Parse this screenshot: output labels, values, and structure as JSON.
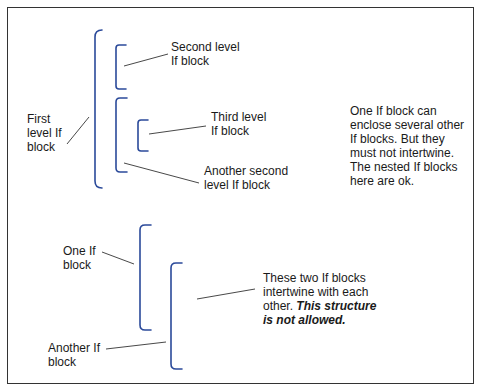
{
  "colors": {
    "bracket": "#2b4a9a",
    "leader": "#333333",
    "frame": "#333333",
    "text": "#1a1a1a"
  },
  "nested_example": {
    "first_level": {
      "lines": [
        "First",
        "level If",
        "block"
      ]
    },
    "second_level_1": {
      "lines": [
        "Second level",
        "If block"
      ]
    },
    "third_level": {
      "lines": [
        "Third level",
        "If block"
      ]
    },
    "second_level_2": {
      "lines": [
        "Another second",
        "level If block"
      ]
    },
    "note": {
      "lines": [
        "One If block can",
        "enclose several other",
        "If blocks. But they",
        "must not intertwine.",
        "The nested If blocks",
        "here are ok."
      ]
    }
  },
  "intertwined_example": {
    "block_1": {
      "lines": [
        "One If",
        "block"
      ]
    },
    "block_2": {
      "lines": [
        "Another If",
        "block"
      ]
    },
    "note": {
      "lines": [
        "These two If blocks",
        "intertwine with each"
      ],
      "line3_plain": "other. ",
      "line3_emphasis": "This structure",
      "line4_emphasis": "is not allowed."
    }
  }
}
